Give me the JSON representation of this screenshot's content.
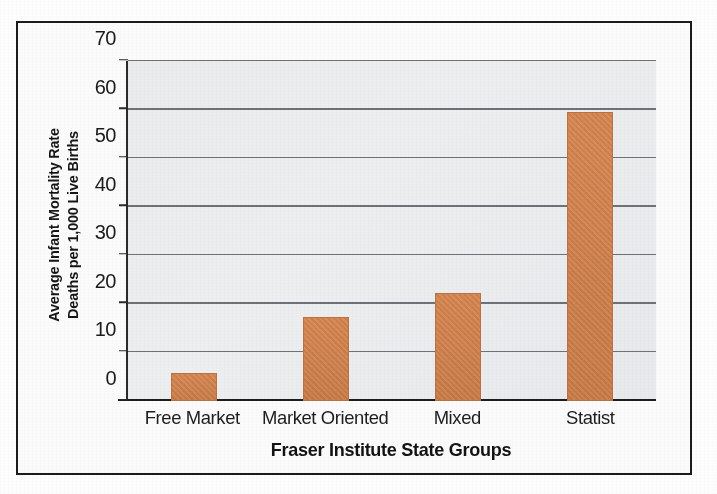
{
  "chart_data": {
    "type": "bar",
    "title": "",
    "xlabel": "Fraser Institute State Groups",
    "ylabel": "Average Infant Mortality Rate Deaths per 1,000 Live Births",
    "ylabel_lines": [
      "Average Infant Mortality Rate",
      "Deaths per 1,000 Live Births"
    ],
    "categories": [
      "Free Market",
      "Market Oriented",
      "Mixed",
      "Statist"
    ],
    "values": [
      5.8,
      17.4,
      22.2,
      59.5
    ],
    "ylim": [
      0,
      70
    ],
    "ytick_labels": [
      "0",
      "10",
      "20",
      "30",
      "40",
      "50",
      "60",
      "70"
    ],
    "ytick_values": [
      0,
      10,
      20,
      30,
      40,
      50,
      60,
      70
    ],
    "grid": true,
    "legend": "none",
    "bar_color": "#cf7f4a",
    "plot_background": "#eaecee",
    "axis_color": "#1d1d1d",
    "gridline_color": "#6e7276"
  },
  "figure": {
    "border_color": "#1c1c1c",
    "page_background": "#fdfdfd"
  }
}
